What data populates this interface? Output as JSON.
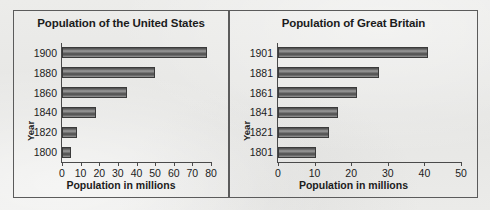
{
  "figure": {
    "background_color": "#e9e9e7",
    "border_color": "#5b5b5b"
  },
  "charts": [
    {
      "panel": "left",
      "title": "Population of the United States",
      "xlabel": "Population in millions",
      "ylabel": "Year",
      "x_ticks": [
        "0",
        "10",
        "20",
        "30",
        "40",
        "50",
        "60",
        "70",
        "80"
      ],
      "y_ticks": [
        "1900",
        "1880",
        "1860",
        "1840",
        "1820",
        "1800"
      ]
    },
    {
      "panel": "right",
      "title": "Population of Great Britain",
      "xlabel": "Population in millions",
      "ylabel": "Year",
      "x_ticks": [
        "0",
        "10",
        "20",
        "30",
        "40",
        "50"
      ],
      "y_ticks": [
        "1901",
        "1881",
        "1861",
        "1841",
        "1821",
        "1801"
      ]
    }
  ],
  "chart_data": [
    {
      "type": "bar",
      "orientation": "horizontal",
      "title": "Population of the United States",
      "xlabel": "Population in millions",
      "ylabel": "Year",
      "categories": [
        "1900",
        "1880",
        "1860",
        "1840",
        "1820",
        "1800"
      ],
      "values": [
        78,
        50,
        35,
        18,
        8,
        5
      ],
      "xlim": [
        0,
        80
      ],
      "xticks": [
        0,
        10,
        20,
        30,
        40,
        50,
        60,
        70,
        80
      ],
      "grid": false,
      "legend": null,
      "bar_color": "#5d5d5d"
    },
    {
      "type": "bar",
      "orientation": "horizontal",
      "title": "Population of Great Britain",
      "xlabel": "Population in millions",
      "ylabel": "Year",
      "categories": [
        "1901",
        "1881",
        "1861",
        "1841",
        "1821",
        "1801"
      ],
      "values": [
        41,
        27.5,
        21.5,
        16.5,
        14,
        10.5
      ],
      "xlim": [
        0,
        50
      ],
      "xticks": [
        0,
        10,
        20,
        30,
        40,
        50
      ],
      "grid": false,
      "legend": null,
      "bar_color": "#5d5d5d"
    }
  ]
}
